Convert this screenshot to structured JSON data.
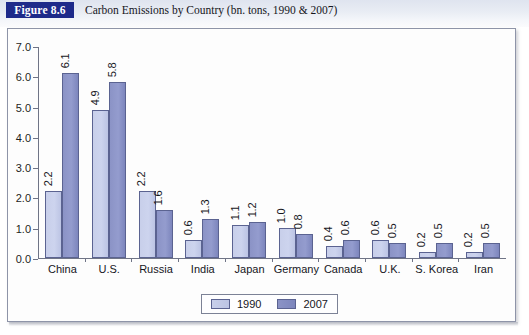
{
  "header": {
    "figure_tag": "Figure 8.6",
    "title": "Carbon Emissions by Country (bn. tons, 1990 & 2007)"
  },
  "legend": {
    "items": [
      {
        "label": "1990",
        "color": "#c8cfea"
      },
      {
        "label": "2007",
        "color": "#8b93c6"
      }
    ]
  },
  "chart_data": {
    "type": "bar",
    "title": "Carbon Emissions by Country (bn. tons, 1990 & 2007)",
    "xlabel": "",
    "ylabel": "",
    "ylim": [
      0.0,
      7.0
    ],
    "ytick_labels": [
      "7.0",
      "6.0",
      "5.0",
      "4.0",
      "3.0",
      "2.0",
      "1.0",
      "0.0"
    ],
    "ytick_values": [
      7.0,
      6.0,
      5.0,
      4.0,
      3.0,
      2.0,
      1.0,
      0.0
    ],
    "grid": false,
    "legend_position": "bottom-center",
    "categories": [
      "China",
      "U.S.",
      "Russia",
      "India",
      "Japan",
      "Germany",
      "Canada",
      "U.K.",
      "S. Korea",
      "Iran"
    ],
    "series": [
      {
        "name": "1990",
        "color": "#c8cfea",
        "values": [
          2.2,
          4.9,
          2.2,
          0.6,
          1.1,
          1.0,
          0.4,
          0.6,
          0.2,
          0.2
        ],
        "value_labels": [
          "2.2",
          "4.9",
          "2.2",
          "0.6",
          "1.1",
          "1.0",
          "0.4",
          "0.6",
          "0.2",
          "0.2"
        ]
      },
      {
        "name": "2007",
        "color": "#8b93c6",
        "values": [
          6.1,
          5.8,
          1.6,
          1.3,
          1.2,
          0.8,
          0.6,
          0.5,
          0.5,
          0.5
        ],
        "value_labels": [
          "6.1",
          "5.8",
          "1.6",
          "1.3",
          "1.2",
          "0.8",
          "0.6",
          "0.5",
          "0.5",
          "0.5"
        ]
      }
    ]
  }
}
